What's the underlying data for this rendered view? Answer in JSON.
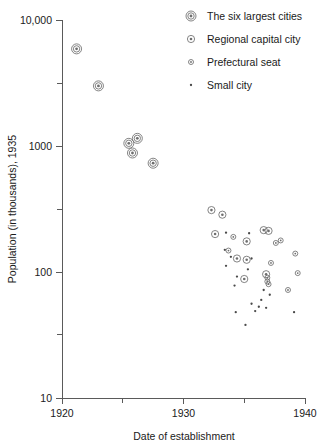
{
  "chart_data": {
    "type": "scatter",
    "title": "",
    "xlabel": "Date of establishment",
    "ylabel": "Population (in thousands), 1935",
    "xlim": [
      1920,
      1940
    ],
    "ylim": [
      10,
      10000
    ],
    "yscale": "log",
    "grid": false,
    "legend_position": "top-right",
    "x_ticks": [
      "1920",
      "1930",
      "1940"
    ],
    "x_tick_values": [
      1920,
      1930,
      1940
    ],
    "x_minor_tick_values": [
      1925,
      1935
    ],
    "y_ticks": [
      "10,000",
      "1000",
      "100",
      "10"
    ],
    "y_tick_values": [
      10000,
      1000,
      100,
      10
    ],
    "y_minor_tick_values": [
      3162,
      316,
      32
    ],
    "legend": [
      {
        "key": "six_largest",
        "label": "The six largest cities",
        "marker": "double-ring-large"
      },
      {
        "key": "regional_capital",
        "label": "Regional capital city",
        "marker": "ring-medium"
      },
      {
        "key": "prefectural_seat",
        "label": "Prefectural seat",
        "marker": "ring-small"
      },
      {
        "key": "small_city",
        "label": "Small city",
        "marker": "dot"
      }
    ],
    "series": [
      {
        "name": "The six largest cities",
        "key": "six_largest",
        "marker": "double-ring-large",
        "points": [
          {
            "x": 1921.2,
            "y": 5900
          },
          {
            "x": 1923.0,
            "y": 3000
          },
          {
            "x": 1925.5,
            "y": 1050
          },
          {
            "x": 1926.2,
            "y": 1150
          },
          {
            "x": 1925.8,
            "y": 880
          },
          {
            "x": 1927.5,
            "y": 730
          }
        ]
      },
      {
        "name": "Regional capital city",
        "key": "regional_capital",
        "marker": "ring-medium",
        "points": [
          {
            "x": 1932.3,
            "y": 310
          },
          {
            "x": 1933.2,
            "y": 285
          },
          {
            "x": 1932.6,
            "y": 200
          },
          {
            "x": 1935.2,
            "y": 175
          },
          {
            "x": 1936.6,
            "y": 215
          },
          {
            "x": 1937.0,
            "y": 212
          },
          {
            "x": 1935.2,
            "y": 125
          },
          {
            "x": 1934.4,
            "y": 128
          },
          {
            "x": 1936.8,
            "y": 96
          },
          {
            "x": 1935.0,
            "y": 88
          }
        ]
      },
      {
        "name": "Prefectural seat",
        "key": "prefectural_seat",
        "marker": "ring-small",
        "points": [
          {
            "x": 1934.1,
            "y": 190
          },
          {
            "x": 1938.0,
            "y": 178
          },
          {
            "x": 1937.6,
            "y": 170
          },
          {
            "x": 1939.2,
            "y": 140
          },
          {
            "x": 1933.7,
            "y": 148
          },
          {
            "x": 1937.2,
            "y": 118
          },
          {
            "x": 1939.4,
            "y": 98
          },
          {
            "x": 1938.6,
            "y": 72
          },
          {
            "x": 1936.9,
            "y": 90
          },
          {
            "x": 1936.9,
            "y": 84
          },
          {
            "x": 1937.0,
            "y": 80
          }
        ]
      },
      {
        "name": "Small city",
        "key": "small_city",
        "marker": "dot",
        "points": [
          {
            "x": 1933.5,
            "y": 205
          },
          {
            "x": 1935.4,
            "y": 203
          },
          {
            "x": 1933.4,
            "y": 150
          },
          {
            "x": 1933.9,
            "y": 132
          },
          {
            "x": 1935.6,
            "y": 128
          },
          {
            "x": 1933.5,
            "y": 112
          },
          {
            "x": 1935.3,
            "y": 105
          },
          {
            "x": 1934.4,
            "y": 92
          },
          {
            "x": 1934.2,
            "y": 78
          },
          {
            "x": 1936.6,
            "y": 72
          },
          {
            "x": 1937.1,
            "y": 66
          },
          {
            "x": 1936.4,
            "y": 60
          },
          {
            "x": 1935.6,
            "y": 56
          },
          {
            "x": 1936.2,
            "y": 53
          },
          {
            "x": 1936.8,
            "y": 52
          },
          {
            "x": 1935.9,
            "y": 49
          },
          {
            "x": 1934.3,
            "y": 48
          },
          {
            "x": 1939.1,
            "y": 48
          },
          {
            "x": 1935.1,
            "y": 38
          }
        ]
      }
    ]
  },
  "geometry": {
    "plot_left": 62,
    "plot_right": 305,
    "plot_top": 20,
    "plot_bottom": 398,
    "y_top_value": 10000,
    "y_bottom_value": 10,
    "legend_x_marker": 191,
    "legend_x_text": 207,
    "legend_y_start": 16,
    "legend_y_step": 23
  }
}
